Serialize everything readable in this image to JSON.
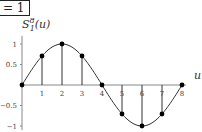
{
  "header": {
    "equation_text": "= 1"
  },
  "chart_data": {
    "type": "line",
    "title": "",
    "xlabel": "u",
    "ylabel": "S_1^8(u)",
    "ylabel_display": "S",
    "ylabel_sup": "8",
    "ylabel_sub": "1",
    "ylabel_arg": "(u)",
    "x": [
      0,
      1,
      2,
      3,
      4,
      5,
      6,
      7,
      8
    ],
    "values": [
      0,
      0.707,
      1,
      0.707,
      0,
      -0.707,
      -1,
      -0.707,
      0
    ],
    "curve": "sin(pi*u/4)",
    "x_ticks": [
      "1",
      "2",
      "3",
      "4",
      "5",
      "6",
      "7",
      "8"
    ],
    "y_ticks": [
      "1",
      "0.5",
      "-0.5",
      "-1"
    ],
    "xlim": [
      0,
      8
    ],
    "ylim": [
      -1,
      1
    ],
    "grid": false,
    "stems": true
  }
}
